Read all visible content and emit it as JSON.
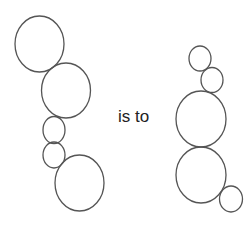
{
  "diagram": {
    "type": "analogy",
    "connector_text": "is to",
    "stroke_color": "#555555",
    "left_figure": {
      "circles": [
        {
          "cx": 39.5,
          "cy": 44,
          "rx": 24.5,
          "ry": 28
        },
        {
          "cx": 66,
          "cy": 90.5,
          "rx": 24.5,
          "ry": 27.5
        },
        {
          "cx": 54,
          "cy": 130,
          "rx": 11,
          "ry": 13.5
        },
        {
          "cx": 54,
          "cy": 155,
          "rx": 11,
          "ry": 13
        },
        {
          "cx": 79.5,
          "cy": 183,
          "rx": 24.5,
          "ry": 28
        }
      ]
    },
    "right_figure": {
      "circles": [
        {
          "cx": 200,
          "cy": 58.5,
          "rx": 11,
          "ry": 12.5
        },
        {
          "cx": 212,
          "cy": 80,
          "rx": 11,
          "ry": 12.5
        },
        {
          "cx": 201,
          "cy": 119,
          "rx": 25,
          "ry": 28
        },
        {
          "cx": 201,
          "cy": 175,
          "rx": 25,
          "ry": 28
        },
        {
          "cx": 231,
          "cy": 199,
          "rx": 11.5,
          "ry": 13
        }
      ]
    }
  }
}
